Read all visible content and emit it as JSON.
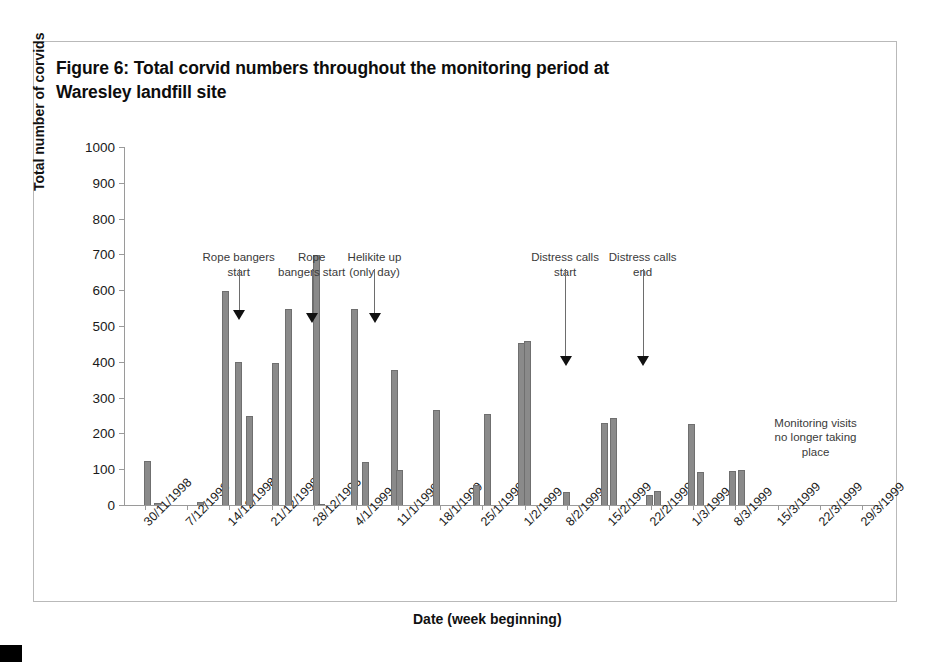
{
  "figure": {
    "caption": "Figure 6: Total corvid numbers throughout the monitoring period at Waresley landfill site",
    "frame_color": "#b9b9b9"
  },
  "note": {
    "no_monitoring": "Monitoring visits\nno longer taking\nplace"
  },
  "chart_data": {
    "type": "bar",
    "title": "Figure 6: Total corvid numbers throughout the monitoring period at Waresley landfill site",
    "xlabel": "Date (week beginning)",
    "ylabel": "Total number of corvids",
    "ylim": [
      0,
      1000
    ],
    "ytick_step": 100,
    "yticks": [
      0,
      100,
      200,
      300,
      400,
      500,
      600,
      700,
      800,
      900,
      1000
    ],
    "ytick_labels": [
      "0",
      "100",
      "200",
      "300",
      "400",
      "500",
      "600",
      "700",
      "800",
      "900",
      "1000"
    ],
    "grid": false,
    "legend": "none",
    "bar_color": "#8a8a8a",
    "categories": [
      "30/11/1998",
      "7/12/1998",
      "14/12/1998",
      "21/12/1998",
      "28/12/1998",
      "4/1/1999",
      "11/1/1999",
      "18/1/1999",
      "25/1/1999",
      "1/2/1999",
      "8/2/1999",
      "15/2/1999",
      "22/2/1999",
      "1/3/1999",
      "8/3/1999",
      "15/3/1999",
      "22/3/1999",
      "29/3/1999"
    ],
    "bars": [
      {
        "x": 0.06,
        "value": 123,
        "label": "30/11/1998 visit 1"
      },
      {
        "x": 0.3,
        "value": 7,
        "label": "30/11/1998 visit 2"
      },
      {
        "x": 1.32,
        "value": 8,
        "label": "7/12/1998 visit"
      },
      {
        "x": 1.9,
        "value": 598,
        "label": "14/12/1998 visit 1"
      },
      {
        "x": 2.22,
        "value": 399,
        "label": "14/12/1998 visit 2"
      },
      {
        "x": 2.48,
        "value": 249,
        "label": "14/12/1998 visit 3"
      },
      {
        "x": 3.09,
        "value": 398,
        "label": "21/12/1998 visit 1"
      },
      {
        "x": 3.4,
        "value": 548,
        "label": "21/12/1998 visit 2"
      },
      {
        "x": 4.06,
        "value": 698,
        "label": "28/12/1998 visit 1"
      },
      {
        "x": 4.19,
        "value": 4,
        "label": "28/12/1998 visit 2"
      },
      {
        "x": 4.96,
        "value": 548,
        "label": "4/1/1999 visit 1"
      },
      {
        "x": 5.23,
        "value": 121,
        "label": "4/1/1999 visit 2"
      },
      {
        "x": 5.92,
        "value": 377,
        "label": "11/1/1999 visit 1"
      },
      {
        "x": 6.03,
        "value": 97,
        "label": "11/1/1999 visit 2"
      },
      {
        "x": 6.9,
        "value": 266,
        "label": "18/1/1999 visit"
      },
      {
        "x": 7.86,
        "value": 56,
        "label": "25/1/1999 visit 1"
      },
      {
        "x": 8.12,
        "value": 253,
        "label": "25/1/1999 visit 2"
      },
      {
        "x": 8.92,
        "value": 453,
        "label": "1/2/1999 visit 1"
      },
      {
        "x": 9.06,
        "value": 458,
        "label": "1/2/1999 visit 2"
      },
      {
        "x": 10.0,
        "value": 36,
        "label": "8/2/1999 visit"
      },
      {
        "x": 10.9,
        "value": 229,
        "label": "15/2/1999 visit 1"
      },
      {
        "x": 11.12,
        "value": 243,
        "label": "15/2/1999 visit 2"
      },
      {
        "x": 11.96,
        "value": 27,
        "label": "22/2/1999 visit 1"
      },
      {
        "x": 12.16,
        "value": 40,
        "label": "22/2/1999 visit 2"
      },
      {
        "x": 12.95,
        "value": 225,
        "label": "1/3/1999 visit 1"
      },
      {
        "x": 13.18,
        "value": 93,
        "label": "1/3/1999 visit 2"
      },
      {
        "x": 13.92,
        "value": 96,
        "label": "8/3/1999 visit 1"
      },
      {
        "x": 14.14,
        "value": 98,
        "label": "8/3/1999 visit 2"
      }
    ],
    "annotations": [
      {
        "id": "rope-bangers-start-1",
        "text": "Rope bangers\nstart",
        "text_x": 2.22,
        "arrow_x": 2.22,
        "text_top": 700,
        "arrow_from": 660,
        "arrow_to": 520
      },
      {
        "id": "rope-bangers-start-2",
        "text": "Rope\nbangers start",
        "text_x": 3.95,
        "arrow_x": 3.95,
        "text_top": 700,
        "arrow_from": 660,
        "arrow_to": 510
      },
      {
        "id": "helikite-up",
        "text": "Helikite up\n(only day)",
        "text_x": 5.44,
        "arrow_x": 5.44,
        "text_top": 700,
        "arrow_from": 660,
        "arrow_to": 510
      },
      {
        "id": "distress-calls-start",
        "text": "Distress calls\nstart",
        "text_x": 9.96,
        "arrow_x": 9.96,
        "text_top": 700,
        "arrow_from": 660,
        "arrow_to": 390
      },
      {
        "id": "distress-calls-end",
        "text": "Distress calls\nend",
        "text_x": 11.8,
        "arrow_x": 11.8,
        "text_top": 700,
        "arrow_from": 660,
        "arrow_to": 390
      }
    ]
  }
}
